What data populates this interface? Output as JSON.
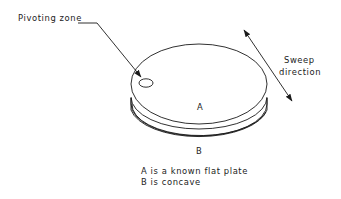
{
  "diagram": {
    "labels": {
      "pivoting_zone": "Pivoting zone",
      "sweep_line1": "Sweep",
      "sweep_line2": "direction",
      "plate_a": "A",
      "plate_b": "B"
    },
    "legend": {
      "line1": "A is a known flat plate",
      "line2": "B is concave"
    },
    "colors": {
      "line": "#1a1a1a",
      "text": "#222222",
      "background": "#ffffff"
    }
  }
}
